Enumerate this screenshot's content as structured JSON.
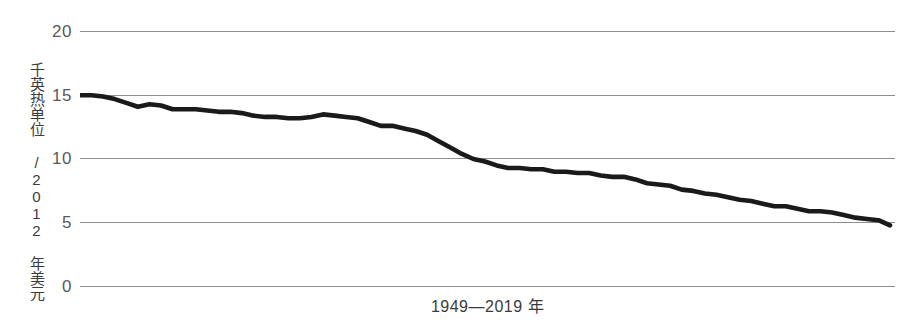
{
  "chart_data": {
    "type": "line",
    "title": "",
    "subtitle": "",
    "xlabel": "1949—2019 年",
    "ylabel": "千英热单位 /2012 年美元",
    "xlim": [
      1949,
      2019
    ],
    "ylim": [
      0,
      20
    ],
    "yticks": [
      20,
      15,
      10,
      5,
      0
    ],
    "ytick_labels": [
      "20",
      "15",
      "10",
      "5",
      "0"
    ],
    "xticks": [],
    "xtick_labels": [],
    "grid": "horizontal",
    "legend": "none",
    "series": [
      {
        "name": "能源强度",
        "color": "#1a1a1a",
        "x": [
          1949,
          1950,
          1951,
          1952,
          1953,
          1954,
          1955,
          1956,
          1957,
          1958,
          1959,
          1960,
          1961,
          1962,
          1963,
          1964,
          1965,
          1966,
          1967,
          1968,
          1969,
          1970,
          1971,
          1972,
          1973,
          1974,
          1975,
          1976,
          1977,
          1978,
          1979,
          1980,
          1981,
          1982,
          1983,
          1984,
          1985,
          1986,
          1987,
          1988,
          1989,
          1990,
          1991,
          1992,
          1993,
          1994,
          1995,
          1996,
          1997,
          1998,
          1999,
          2000,
          2001,
          2002,
          2003,
          2004,
          2005,
          2006,
          2007,
          2008,
          2009,
          2010,
          2011,
          2012,
          2013,
          2014,
          2015,
          2016,
          2017,
          2018,
          2019
        ],
        "y": [
          15.0,
          15.0,
          14.9,
          14.7,
          14.4,
          14.1,
          14.3,
          14.2,
          13.9,
          13.9,
          13.9,
          13.8,
          13.7,
          13.7,
          13.6,
          13.4,
          13.3,
          13.3,
          13.2,
          13.2,
          13.3,
          13.5,
          13.4,
          13.3,
          13.2,
          12.9,
          12.6,
          12.6,
          12.4,
          12.2,
          11.9,
          11.4,
          10.9,
          10.4,
          10.0,
          9.8,
          9.5,
          9.3,
          9.3,
          9.2,
          9.2,
          9.0,
          9.0,
          8.9,
          8.9,
          8.7,
          8.6,
          8.6,
          8.4,
          8.1,
          8.0,
          7.9,
          7.6,
          7.5,
          7.3,
          7.2,
          7.0,
          6.8,
          6.7,
          6.5,
          6.3,
          6.3,
          6.1,
          5.9,
          5.9,
          5.8,
          5.6,
          5.4,
          5.3,
          5.2,
          4.8
        ]
      }
    ]
  }
}
